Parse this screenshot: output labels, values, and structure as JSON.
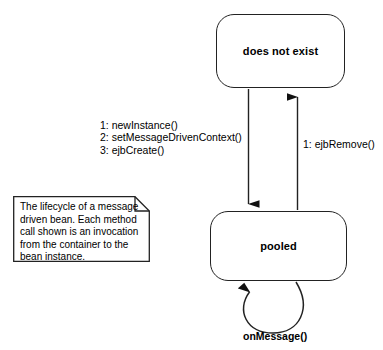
{
  "diagram": {
    "states": [
      {
        "id": "does-not-exist",
        "label": "does not exist"
      },
      {
        "id": "pooled",
        "label": "pooled"
      }
    ],
    "transitions": [
      {
        "id": "create-sequence",
        "from": "does not exist",
        "to": "pooled",
        "direction": "down",
        "label": "1: newInstance()\n2: setMessageDrivenContext()\n3: ejbCreate()"
      },
      {
        "id": "ejb-remove",
        "from": "pooled",
        "to": "does not exist",
        "direction": "up",
        "label": "1: ejbRemove()"
      },
      {
        "id": "on-message",
        "from": "pooled",
        "to": "pooled",
        "direction": "self-loop",
        "label": "onMessage()"
      }
    ],
    "note": {
      "id": "lifecycle-note",
      "text": "The lifecycle of a message driven bean.  Each method call shown is an invocation from the container to the bean instance."
    },
    "colors": {
      "stroke": "#222222",
      "text": "#000000",
      "background": "#ffffff"
    }
  }
}
